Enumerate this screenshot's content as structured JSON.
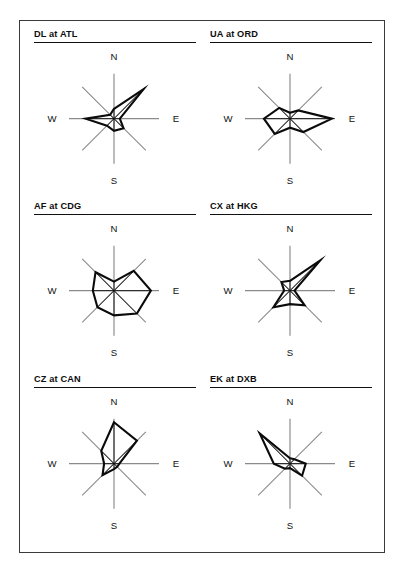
{
  "figure": {
    "border_color": "#3a3a3a",
    "background": "#ffffff",
    "rose_stroke_color": "#0b0b0b",
    "axis_stroke_color": "#8a8a8a"
  },
  "compass": {
    "north": "N",
    "east": "E",
    "south": "S",
    "west": "W"
  },
  "chart_data": {
    "type": "line",
    "subtype": "wind-rose-polygon-grid",
    "title": "",
    "xlabel": "",
    "ylabel": "",
    "grid": true,
    "legend_position": "none",
    "directions": [
      "N",
      "NE",
      "E",
      "SE",
      "S",
      "SW",
      "W",
      "NW"
    ],
    "direction_angles_deg": [
      0,
      45,
      90,
      135,
      180,
      225,
      270,
      315
    ],
    "radial_range": [
      0,
      1
    ],
    "axis_radius_px": 45,
    "panels": [
      {
        "title": "DL at ATL",
        "values": [
          0.22,
          0.93,
          0.13,
          0.3,
          0.27,
          0.22,
          0.63,
          0.12
        ]
      },
      {
        "title": "UA at ORD",
        "values": [
          0.13,
          0.26,
          0.93,
          0.42,
          0.2,
          0.48,
          0.58,
          0.34
        ]
      },
      {
        "title": "AF at CDG",
        "values": [
          0.2,
          0.62,
          0.82,
          0.72,
          0.55,
          0.52,
          0.47,
          0.58
        ]
      },
      {
        "title": "CX at HKG",
        "values": [
          0.22,
          0.95,
          0.1,
          0.46,
          0.3,
          0.52,
          0.13,
          0.27
        ]
      },
      {
        "title": "CZ at CAN",
        "values": [
          0.92,
          0.72,
          0.12,
          0.1,
          0.12,
          0.36,
          0.22,
          0.4
        ]
      },
      {
        "title": "EK at DXB",
        "values": [
          0.12,
          0.14,
          0.35,
          0.38,
          0.1,
          0.16,
          0.36,
          0.95
        ]
      }
    ]
  }
}
